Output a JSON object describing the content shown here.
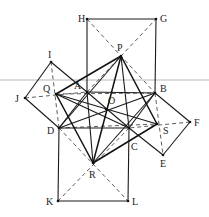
{
  "diagram": {
    "type": "geometry",
    "colors": {
      "line": "#1a1a1a",
      "dashed": "#333333",
      "rule": "#b8b8b8",
      "background": "#ffffff"
    },
    "points": {
      "H": {
        "x": 87,
        "y": 19,
        "label": "H",
        "lx": 78,
        "ly": 22
      },
      "G": {
        "x": 156,
        "y": 19,
        "label": "G",
        "lx": 160,
        "ly": 22
      },
      "P": {
        "x": 121,
        "y": 56,
        "label": "P",
        "lx": 117,
        "ly": 51
      },
      "I": {
        "x": 51,
        "y": 62,
        "label": "I",
        "lx": 48,
        "ly": 58
      },
      "A": {
        "x": 87,
        "y": 92,
        "label": "A",
        "lx": 74,
        "ly": 89
      },
      "B": {
        "x": 155,
        "y": 93,
        "label": "B",
        "lx": 160,
        "ly": 92
      },
      "J": {
        "x": 25,
        "y": 98,
        "label": "J",
        "lx": 15,
        "ly": 102
      },
      "Q": {
        "x": 56,
        "y": 94,
        "label": "Q",
        "lx": 43,
        "ly": 92
      },
      "O": {
        "x": 106,
        "y": 109,
        "label": "O",
        "lx": 108,
        "ly": 104
      },
      "D": {
        "x": 59,
        "y": 128,
        "label": "D",
        "lx": 47,
        "ly": 134
      },
      "C": {
        "x": 129,
        "y": 128,
        "label": "C",
        "lx": 131,
        "ly": 150
      },
      "S": {
        "x": 157,
        "y": 124,
        "label": "S",
        "lx": 163,
        "ly": 134
      },
      "F": {
        "x": 190,
        "y": 122,
        "label": "F",
        "lx": 194,
        "ly": 126
      },
      "E": {
        "x": 163,
        "y": 155,
        "label": "E",
        "lx": 160,
        "ly": 167
      },
      "R": {
        "x": 93,
        "y": 163,
        "label": "R",
        "lx": 89,
        "ly": 178
      },
      "K": {
        "x": 58,
        "y": 201,
        "label": "K",
        "lx": 46,
        "ly": 205
      },
      "L": {
        "x": 128,
        "y": 201,
        "label": "L",
        "lx": 132,
        "ly": 205
      }
    },
    "solid_segments": [
      [
        "A",
        "H"
      ],
      [
        "H",
        "G"
      ],
      [
        "G",
        "B"
      ],
      [
        "A",
        "B"
      ],
      [
        "B",
        "F"
      ],
      [
        "F",
        "E"
      ],
      [
        "E",
        "C"
      ],
      [
        "B",
        "C"
      ],
      [
        "C",
        "L"
      ],
      [
        "L",
        "K"
      ],
      [
        "K",
        "D"
      ],
      [
        "D",
        "C"
      ],
      [
        "D",
        "J"
      ],
      [
        "J",
        "I"
      ],
      [
        "I",
        "A"
      ],
      [
        "A",
        "D"
      ],
      [
        "A",
        "C"
      ],
      [
        "B",
        "D"
      ],
      [
        "Q",
        "C"
      ],
      [
        "P",
        "C"
      ],
      [
        "P",
        "D"
      ],
      [
        "Q",
        "S"
      ],
      [
        "R",
        "B"
      ],
      [
        "R",
        "A"
      ]
    ],
    "thick_segments": [
      [
        "P",
        "Q"
      ],
      [
        "Q",
        "R"
      ],
      [
        "R",
        "S"
      ],
      [
        "S",
        "P"
      ],
      [
        "P",
        "R"
      ]
    ],
    "dashed_segments": [
      [
        "H",
        "B"
      ],
      [
        "A",
        "G"
      ],
      [
        "B",
        "E"
      ],
      [
        "F",
        "C"
      ],
      [
        "C",
        "K"
      ],
      [
        "D",
        "L"
      ],
      [
        "D",
        "I"
      ],
      [
        "J",
        "A"
      ],
      [
        "Q",
        "B"
      ],
      [
        "D",
        "S"
      ]
    ],
    "rule_line": {
      "y": 80
    }
  }
}
